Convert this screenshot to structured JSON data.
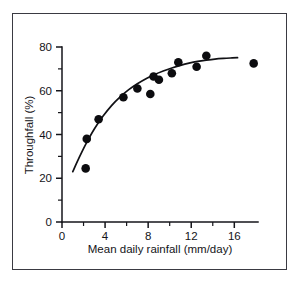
{
  "figure": {
    "frame_border_color": "#3a3a42",
    "background_color": "#ffffff",
    "ink_color": "#111115"
  },
  "axes": {
    "x": {
      "title": "Mean daily rainfall (mm/day)",
      "tick_labels": [
        "0",
        "4",
        "8",
        "12",
        "16"
      ],
      "tick_values": [
        0,
        4,
        8,
        12,
        16
      ],
      "minor_tick_values": [
        2,
        6,
        10,
        14
      ],
      "range": [
        0,
        18.2
      ]
    },
    "y": {
      "title": "Throughfall (%)",
      "tick_labels": [
        "0",
        "20",
        "40",
        "60",
        "80"
      ],
      "tick_values": [
        0,
        20,
        40,
        60,
        80
      ],
      "minor_tick_values": [
        10,
        30,
        50,
        70
      ],
      "range": [
        0,
        80
      ]
    }
  },
  "chart_data": {
    "type": "scatter",
    "title": "",
    "xlabel": "Mean daily rainfall (mm/day)",
    "ylabel": "Throughfall (%)",
    "xlim": [
      0,
      18.2
    ],
    "ylim": [
      0,
      80
    ],
    "grid": false,
    "legend": false,
    "x": [
      2.2,
      2.3,
      3.4,
      5.7,
      7.0,
      8.2,
      8.5,
      9.0,
      10.2,
      10.8,
      12.5,
      13.4,
      17.8
    ],
    "y": [
      24.5,
      38.0,
      47.0,
      57.0,
      61.0,
      58.5,
      66.5,
      65.0,
      68.0,
      73.0,
      71.0,
      76.0,
      72.5
    ],
    "series": [
      {
        "name": "Observations",
        "marker": "filled-circle",
        "marker_size_px": 4.3,
        "color": "#0c0c0f",
        "points": [
          {
            "x": 2.2,
            "y": 24.5
          },
          {
            "x": 2.3,
            "y": 38.0
          },
          {
            "x": 3.4,
            "y": 47.0
          },
          {
            "x": 5.7,
            "y": 57.0
          },
          {
            "x": 7.0,
            "y": 61.0
          },
          {
            "x": 8.2,
            "y": 58.5
          },
          {
            "x": 8.5,
            "y": 66.5
          },
          {
            "x": 9.0,
            "y": 65.0
          },
          {
            "x": 10.2,
            "y": 68.0
          },
          {
            "x": 10.8,
            "y": 73.0
          },
          {
            "x": 12.5,
            "y": 71.0
          },
          {
            "x": 13.4,
            "y": 76.0
          },
          {
            "x": 17.8,
            "y": 72.5
          }
        ]
      },
      {
        "name": "Fitted curve",
        "marker": "none",
        "line": "solid",
        "color": "#111115",
        "points": [
          {
            "x": 1.0,
            "y": 23.0
          },
          {
            "x": 1.6,
            "y": 29.5
          },
          {
            "x": 2.2,
            "y": 35.5
          },
          {
            "x": 3.0,
            "y": 42.5
          },
          {
            "x": 3.8,
            "y": 48.3
          },
          {
            "x": 4.6,
            "y": 53.2
          },
          {
            "x": 5.4,
            "y": 57.2
          },
          {
            "x": 6.2,
            "y": 60.5
          },
          {
            "x": 7.0,
            "y": 63.2
          },
          {
            "x": 7.8,
            "y": 65.5
          },
          {
            "x": 8.6,
            "y": 67.4
          },
          {
            "x": 9.4,
            "y": 69.0
          },
          {
            "x": 10.2,
            "y": 70.4
          },
          {
            "x": 11.0,
            "y": 71.6
          },
          {
            "x": 11.8,
            "y": 72.6
          },
          {
            "x": 12.6,
            "y": 73.4
          },
          {
            "x": 13.4,
            "y": 74.0
          },
          {
            "x": 14.2,
            "y": 74.5
          },
          {
            "x": 15.0,
            "y": 74.8
          },
          {
            "x": 15.8,
            "y": 75.0
          },
          {
            "x": 16.3,
            "y": 75.1
          }
        ]
      }
    ]
  }
}
